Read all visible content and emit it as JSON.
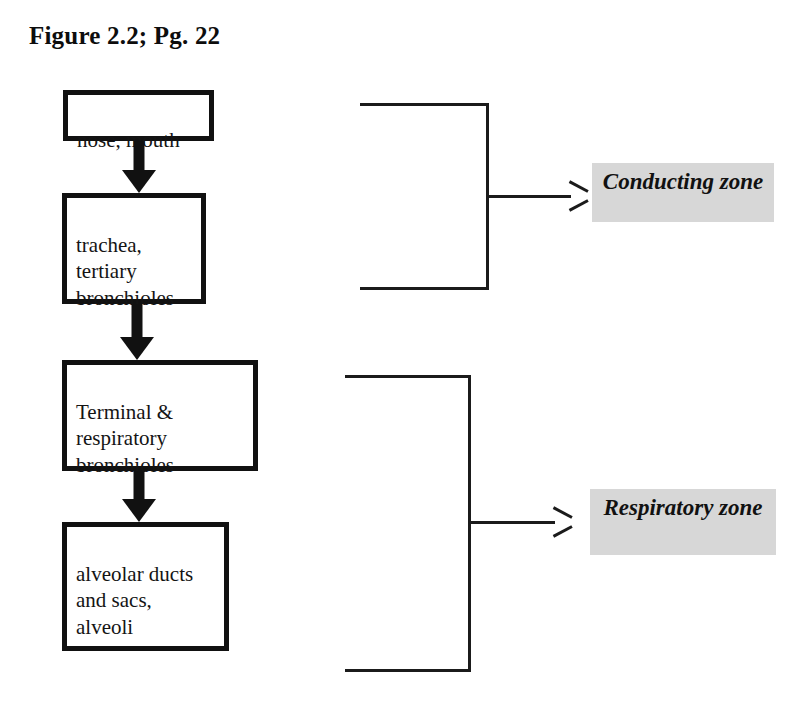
{
  "figure": {
    "title": "Figure 2.2; Pg. 22"
  },
  "flow": {
    "boxes": [
      {
        "id": "nose-mouth",
        "text": "nose, mouth"
      },
      {
        "id": "trachea-bronchioles",
        "text": "trachea,\ntertiary\nbronchioles"
      },
      {
        "id": "terminal-bronchioles",
        "text": "Terminal &\nrespiratory\nbronchioles"
      },
      {
        "id": "alveolar-ducts-alveoli",
        "text": "alveolar ducts\nand sacs,\nalveoli"
      }
    ],
    "arrow_icon": "down-block-arrow-icon"
  },
  "zones": [
    {
      "id": "conducting",
      "label": "Conducting zone",
      "bracket_spans": [
        "nose-mouth",
        "trachea-bronchioles"
      ]
    },
    {
      "id": "respiratory",
      "label": "Respiratory zone",
      "bracket_spans": [
        "terminal-bronchioles",
        "alveolar-ducts-alveoli"
      ]
    }
  ],
  "colors": {
    "ink": "#111111",
    "highlight": "#d7d7d7",
    "page": "#ffffff"
  }
}
